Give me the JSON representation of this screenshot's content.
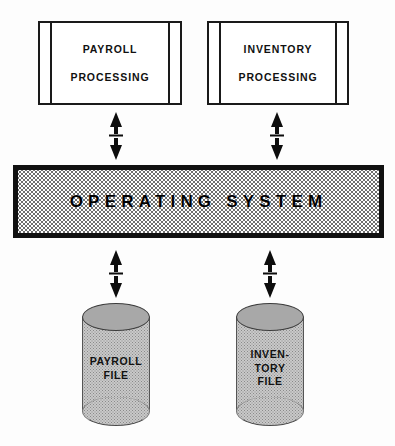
{
  "diagram": {
    "background_color": "#fdfdfd",
    "ink_color": "#111111",
    "os_fill_color": "#ffffff",
    "cylinder_body_color": "#c9c9c9",
    "cylinder_top_color": "#a8a8a8"
  },
  "processes": [
    {
      "id": "payroll-processing",
      "line1": "PAYROLL",
      "line2": "PROCESSING",
      "shape": "predefined-process"
    },
    {
      "id": "inventory-processing",
      "line1": "INVENTORY",
      "line2": "PROCESSING",
      "shape": "predefined-process"
    }
  ],
  "operating_system": {
    "label": "OPERATING SYSTEM",
    "shape": "thick-bordered-bar"
  },
  "files": [
    {
      "id": "payroll-file",
      "shape": "cylinder",
      "lines": [
        "PAYROLL",
        "FILE"
      ]
    },
    {
      "id": "inventory-file",
      "shape": "cylinder",
      "lines": [
        "INVEN-",
        "TORY",
        "FILE"
      ]
    }
  ],
  "connectors": [
    {
      "id": "payroll-processing-to-os",
      "type": "double-headed-arrow",
      "orientation": "vertical"
    },
    {
      "id": "inventory-processing-to-os",
      "type": "double-headed-arrow",
      "orientation": "vertical"
    },
    {
      "id": "os-to-payroll-file",
      "type": "double-headed-arrow",
      "orientation": "vertical"
    },
    {
      "id": "os-to-inventory-file",
      "type": "double-headed-arrow",
      "orientation": "vertical"
    }
  ]
}
